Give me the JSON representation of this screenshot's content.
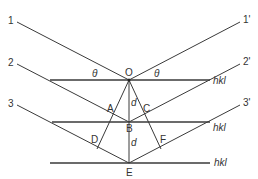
{
  "diagram": {
    "incident_rays": [
      "1",
      "2",
      "3"
    ],
    "diffracted_rays": [
      "1'",
      "2'",
      "3'"
    ],
    "points": {
      "O": "O",
      "A": "A",
      "B": "B",
      "C": "C",
      "D": "D",
      "E": "E",
      "F": "F"
    },
    "angle_label": "θ",
    "spacing_label": "d",
    "plane_label": "hkl"
  }
}
